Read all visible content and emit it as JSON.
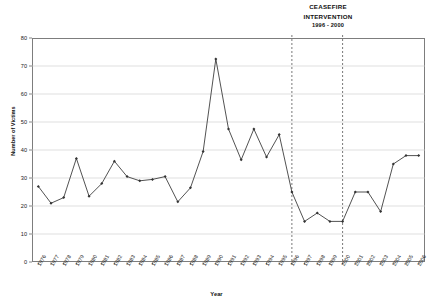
{
  "annotation": {
    "line1": "CEASEFIRE",
    "line2": "INTERVENTION",
    "period": "1996 - 2000"
  },
  "axes": {
    "ylabel": "Number of Victims",
    "xlabel": "Year",
    "yticks": [
      "0",
      "10",
      "20",
      "30",
      "40",
      "50",
      "60",
      "70",
      "80"
    ]
  },
  "chart_data": {
    "type": "line",
    "title": "",
    "subtitle": "",
    "xlabel": "Year",
    "ylabel": "Number of Victims",
    "ylim": [
      0,
      80
    ],
    "ytick_step": 10,
    "grid": true,
    "legend": null,
    "marker": "filled-diamond",
    "series_color": "#333333",
    "annotations": [
      {
        "text": "CEASEFIRE INTERVENTION 1996 - 2000",
        "type": "vertical-span",
        "x_start": "1996",
        "x_end": "2000",
        "line_style": "dashed",
        "color": "#555555"
      }
    ],
    "categories": [
      "1976",
      "1977",
      "1978",
      "1979",
      "1980",
      "1981",
      "1982",
      "1983",
      "1984",
      "1985",
      "1986",
      "1987",
      "1988",
      "1989",
      "1990",
      "1991",
      "1992",
      "1993",
      "1994",
      "1995",
      "1996",
      "1997",
      "1998",
      "1999",
      "2000",
      "2001",
      "2002",
      "2003",
      "2004",
      "2005",
      "2006"
    ],
    "values": [
      27,
      21,
      23,
      37,
      23.5,
      28,
      36,
      30.5,
      29,
      29.5,
      30.5,
      21.5,
      26.5,
      39.5,
      72.5,
      47.5,
      36.5,
      47.5,
      37.5,
      45.5,
      25,
      14.5,
      17.5,
      14.5,
      14.5,
      25,
      25,
      18,
      35,
      38,
      38
    ]
  }
}
